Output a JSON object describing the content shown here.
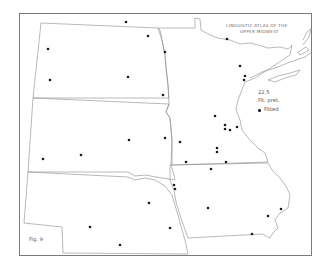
{
  "map": {
    "title_lines": [
      "Linguistic Atlas of the",
      "Upper Midwest"
    ],
    "figure_label": "Fig. 9",
    "legend": {
      "item_number": "22.5",
      "heading": "Fit, pret.",
      "entries": [
        {
          "symbol": "dot",
          "label": "Fitted"
        }
      ]
    },
    "colors": {
      "line": "#8a8a8a",
      "dot": "#1a1a1a",
      "frame": "#7a7a7a",
      "background": "#ffffff"
    },
    "regions": [
      "North Dakota",
      "South Dakota",
      "Nebraska",
      "Minnesota",
      "Iowa"
    ],
    "points": [
      {
        "x": 126,
        "y": 22
      },
      {
        "x": 148,
        "y": 36
      },
      {
        "x": 48,
        "y": 49
      },
      {
        "x": 165,
        "y": 52
      },
      {
        "x": 50,
        "y": 80
      },
      {
        "x": 128,
        "y": 77
      },
      {
        "x": 163,
        "y": 95
      },
      {
        "x": 227,
        "y": 39
      },
      {
        "x": 240,
        "y": 66
      },
      {
        "x": 245,
        "y": 76
      },
      {
        "x": 244,
        "y": 80
      },
      {
        "x": 215,
        "y": 116
      },
      {
        "x": 225,
        "y": 125
      },
      {
        "x": 225,
        "y": 129
      },
      {
        "x": 230,
        "y": 130
      },
      {
        "x": 237,
        "y": 127
      },
      {
        "x": 129,
        "y": 140
      },
      {
        "x": 165,
        "y": 138
      },
      {
        "x": 180,
        "y": 142
      },
      {
        "x": 43,
        "y": 159
      },
      {
        "x": 81,
        "y": 155
      },
      {
        "x": 217,
        "y": 148
      },
      {
        "x": 217,
        "y": 152
      },
      {
        "x": 186,
        "y": 162
      },
      {
        "x": 226,
        "y": 162
      },
      {
        "x": 211,
        "y": 169
      },
      {
        "x": 174,
        "y": 185
      },
      {
        "x": 175,
        "y": 189
      },
      {
        "x": 149,
        "y": 203
      },
      {
        "x": 208,
        "y": 208
      },
      {
        "x": 281,
        "y": 209
      },
      {
        "x": 268,
        "y": 216
      },
      {
        "x": 90,
        "y": 227
      },
      {
        "x": 170,
        "y": 228
      },
      {
        "x": 120,
        "y": 245
      },
      {
        "x": 252,
        "y": 234
      }
    ]
  }
}
